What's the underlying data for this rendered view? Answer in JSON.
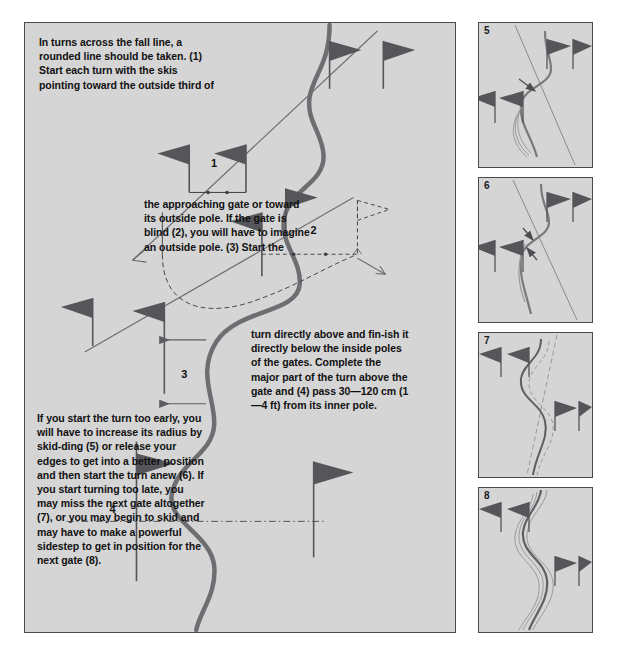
{
  "figure": {
    "type": "instructional-diagram",
    "background_color": "#ffffff",
    "panel_fill": "#d5d5d5",
    "panel_border": "#4a4a4a",
    "flag_color": "#55555a",
    "track_color": "#6e6e72"
  },
  "main_panel": {
    "name": "main-diagram",
    "text_blocks": [
      {
        "id": "a",
        "text": "In turns across the fall line, a rounded line should be taken. (1) Start each turn with the skis pointing toward the outside third of"
      },
      {
        "id": "b",
        "text": "the approaching gate or toward its outside pole. If the gate is blind (2), you will have to imagine an outside pole. (3) Start the"
      },
      {
        "id": "c",
        "text": "turn directly above and fin-ish it directly below the inside poles of the gates. Complete the major part of the turn above the gate and (4) pass 30—120 cm (1—4 ft) from its inner pole."
      },
      {
        "id": "d",
        "text": "If you start the turn too early, you will have to increase its radius by skid-ding (5) or release your edges to get into a better position and then start the turn anew (6). If you start turning too late, you may miss the next gate altogether (7), or you may begin to skid and may have to make a powerful sidestep to get in position for the next gate (8)."
      }
    ],
    "gate_labels": [
      "1",
      "2",
      "3",
      "4"
    ],
    "gate_notes": [
      "Gate 1 — skis pointing toward the outside third of the approaching gate",
      "Gate 2 — blind gate with imagined outside pole (dashed)",
      "Gate 3 — turn started directly above and finished directly below the inside pole",
      "Gate 4 — pass 30—120 cm (1—4 ft) from the inner pole"
    ]
  },
  "side_panels": [
    {
      "number": "5",
      "caption": "Turn started too early — radius increased by skidding"
    },
    {
      "number": "6",
      "caption": "Edges released, turn started anew"
    },
    {
      "number": "7",
      "caption": "Turn started too late — next gate missed altogether"
    },
    {
      "number": "8",
      "caption": "Skid, then a powerful sidestep to regain position"
    }
  ]
}
